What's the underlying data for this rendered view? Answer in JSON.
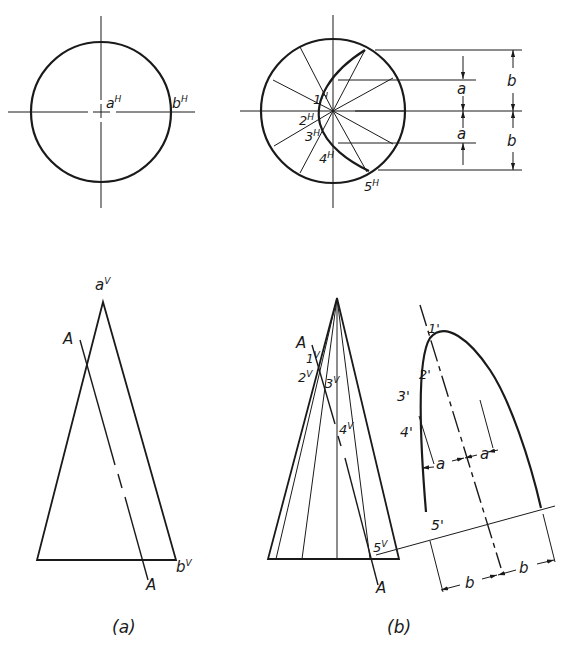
{
  "figure": {
    "captions": {
      "a": "(a)",
      "b": "(b)"
    },
    "view_a": {
      "top_labels": {
        "center": "a",
        "center_sup": "H",
        "edge": "b",
        "edge_sup": "H"
      },
      "front_labels": {
        "apex": "a",
        "apex_sup": "V",
        "base": "b",
        "base_sup": "V",
        "plane_top": "A",
        "plane_bottom": "A"
      }
    },
    "view_b": {
      "top_points": [
        {
          "n": "1",
          "sup": "H"
        },
        {
          "n": "2",
          "sup": "H"
        },
        {
          "n": "3",
          "sup": "H"
        },
        {
          "n": "4",
          "sup": "H"
        },
        {
          "n": "5",
          "sup": "H"
        }
      ],
      "dimensions": {
        "a1": "a",
        "a2": "a",
        "b1": "b",
        "b2": "b"
      },
      "front_points": [
        {
          "n": "1",
          "sup": "V"
        },
        {
          "n": "2",
          "sup": "V"
        },
        {
          "n": "3",
          "sup": "V"
        },
        {
          "n": "4",
          "sup": "V"
        },
        {
          "n": "5",
          "sup": "V"
        }
      ],
      "plane_top": "A",
      "plane_bottom": "A",
      "true_shape_points": [
        "1'",
        "2'",
        "3'",
        "4'",
        "5'"
      ],
      "true_shape_dims": {
        "a1": "a",
        "a2": "a",
        "b1": "b",
        "b2": "b"
      }
    }
  }
}
